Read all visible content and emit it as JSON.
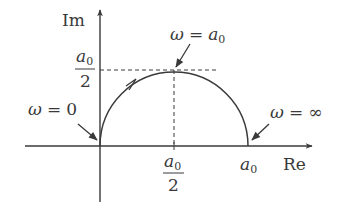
{
  "diagram": {
    "type": "nyquist-plot",
    "axes": {
      "real_label": "Re",
      "imag_label": "Im"
    },
    "curve": {
      "shape": "semicircle",
      "center_re_fraction_of_a0": 0.5,
      "radius_fraction_of_a0": 0.5,
      "direction": "counterclockwise-from-origin"
    },
    "ticks": {
      "re_half": {
        "num": "a",
        "sub": "0",
        "den": "2"
      },
      "re_full": {
        "base": "a",
        "sub": "0"
      },
      "im_half": {
        "num": "a",
        "sub": "0",
        "den": "2"
      }
    },
    "annotations": {
      "omega_zero": {
        "lhs": "ω",
        "eq": "=",
        "rhs": "0"
      },
      "omega_a0": {
        "lhs": "ω",
        "eq": "=",
        "rhs_base": "a",
        "rhs_sub": "0"
      },
      "omega_inf": {
        "lhs": "ω",
        "eq": "=",
        "rhs": "∞"
      }
    },
    "colors": {
      "line": "#3a3a3a",
      "background": "#ffffff"
    }
  }
}
